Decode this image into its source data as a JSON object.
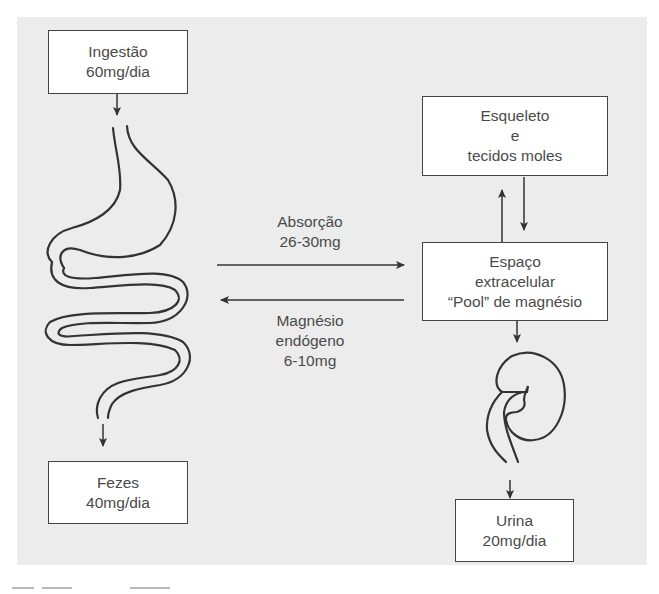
{
  "diagram": {
    "colors": {
      "background": "#ececec",
      "box_fill": "#ffffff",
      "line": "#333333",
      "text": "#4a4a4a"
    },
    "nodes": {
      "intake": {
        "line1": "Ingestão",
        "line2": "60mg/dia"
      },
      "feces": {
        "line1": "Fezes",
        "line2": "40mg/dia"
      },
      "skeleton": {
        "line1": "Esqueleto",
        "line2": "e",
        "line3": "tecidos moles"
      },
      "extracellular": {
        "line1": "Espaço",
        "line2": "extracelular",
        "line3": "“Pool” de magnésio"
      },
      "urine": {
        "line1": "Urina",
        "line2": "20mg/dia"
      }
    },
    "edges": {
      "absorption": {
        "line1": "Absorção",
        "line2": "26-30mg"
      },
      "endogenous": {
        "line1": "Magnésio",
        "line2": "endógeno",
        "line3": "6-10mg"
      }
    },
    "illustrations": [
      "gastrointestinal-tract",
      "kidney"
    ]
  }
}
